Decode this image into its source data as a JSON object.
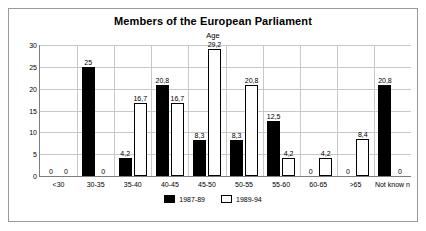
{
  "chart_data": {
    "type": "bar",
    "title": "Members of the European Parliament",
    "subtitle": "Age",
    "xlabel": "",
    "ylabel": "",
    "ylim": [
      0,
      30
    ],
    "yticks": [
      0,
      5,
      10,
      15,
      20,
      25,
      30
    ],
    "grid": true,
    "legend_position": "bottom",
    "categories": [
      "<30",
      "30-35",
      "35-40",
      "40-45",
      "45-50",
      "50-55",
      "55-60",
      "60-65",
      ">65",
      "Not know n"
    ],
    "series": [
      {
        "name": "1987-89",
        "color": "#000000",
        "values": [
          0,
          25,
          4.2,
          20.8,
          8.3,
          8.3,
          12.5,
          0,
          0,
          20.8
        ],
        "labels": [
          "0",
          "25",
          "4,2",
          "20,8",
          "8,3",
          "8,3",
          "12,5",
          "0",
          "0",
          "20,8"
        ]
      },
      {
        "name": "1989-94",
        "color": "#ffffff",
        "values": [
          0,
          0,
          16.7,
          16.7,
          29.2,
          20.8,
          4.2,
          4.2,
          8.4,
          0
        ],
        "labels": [
          "0",
          "0",
          "16,7",
          "16,7",
          "29,2",
          "20,8",
          "4,2",
          "4,2",
          "8,4",
          "0"
        ]
      }
    ]
  },
  "legend": {
    "items": [
      {
        "label": "1987-89",
        "swatch": "series-a"
      },
      {
        "label": "1989-94",
        "swatch": "series-b"
      }
    ]
  },
  "colors": {
    "series_a": "#000000",
    "series_b": "#ffffff",
    "grid": "#c8c8c8",
    "axis": "#7d7d7d",
    "frame": "#9a9a9a"
  }
}
